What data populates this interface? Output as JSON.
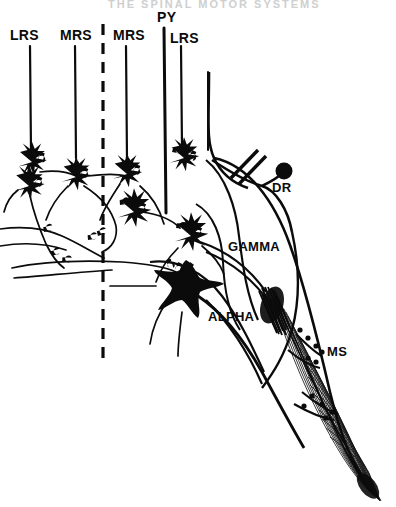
{
  "figure": {
    "kind": "neuroanatomy-schematic",
    "title_faint": "THE SPINAL MOTOR SYSTEMS",
    "background_color": "#ffffff",
    "ink_color": "#0b0b0b",
    "width": 396,
    "height": 507
  },
  "afferent_labels": [
    {
      "id": "lrs-left",
      "text": "LRS",
      "x": 10,
      "y": 28
    },
    {
      "id": "mrs-left",
      "text": "MRS",
      "x": 60,
      "y": 28
    },
    {
      "id": "mrs-right",
      "text": "MRS",
      "x": 113,
      "y": 28
    },
    {
      "id": "py",
      "text": "PY",
      "x": 157,
      "y": 10
    },
    {
      "id": "lrs-right",
      "text": "LRS",
      "x": 170,
      "y": 31
    }
  ],
  "structure_labels": [
    {
      "id": "dr",
      "text": "DR",
      "x": 272,
      "y": 181
    },
    {
      "id": "gamma",
      "text": "GAMMA",
      "x": 228,
      "y": 240
    },
    {
      "id": "alpha",
      "text": "ALPHA",
      "x": 208,
      "y": 310
    },
    {
      "id": "ms",
      "text": "MS",
      "x": 327,
      "y": 345
    }
  ],
  "tract_lines": [
    {
      "id": "lrs-left-fiber",
      "x": 30,
      "y1": 46,
      "y2": 152,
      "width": 2.2
    },
    {
      "id": "mrs-left-fiber",
      "x": 75,
      "y1": 46,
      "y2": 158,
      "width": 2.2
    },
    {
      "id": "mrs-right-fiber",
      "x": 126,
      "y1": 46,
      "y2": 160,
      "width": 2.2
    },
    {
      "id": "py-fiber",
      "x": 164,
      "y1": 28,
      "y2": 213,
      "width": 3.0
    },
    {
      "id": "lrs-right-fiber",
      "x": 181,
      "y1": 46,
      "y2": 148,
      "width": 2.2
    },
    {
      "id": "far-right-fiber",
      "x": 208,
      "y1": 72,
      "y2": 152,
      "width": 2.0
    }
  ],
  "midline": {
    "id": "midline-dashed",
    "x": 103,
    "y1": 24,
    "y2": 360,
    "dash": "11 8",
    "width": 3.2
  },
  "dorsal_root": {
    "ganglion_cx": 284,
    "ganglion_cy": 171,
    "ganglion_r": 8.5,
    "cut_marks": 2
  },
  "muscle_spindle": {
    "label": "MS",
    "fiber_count": 26,
    "origin_x": 276,
    "origin_y": 292,
    "insertion_x": 372,
    "insertion_y": 492
  },
  "neurons": [
    {
      "id": "interneuron-lrs-left-upper",
      "cx": 32,
      "cy": 162,
      "r": 9
    },
    {
      "id": "interneuron-lrs-left-lower",
      "cx": 29,
      "cy": 185,
      "r": 9
    },
    {
      "id": "interneuron-mrs-left",
      "cx": 76,
      "cy": 176,
      "r": 9
    },
    {
      "id": "interneuron-mrs-right-up",
      "cx": 127,
      "cy": 173,
      "r": 9
    },
    {
      "id": "interneuron-mrs-right-low",
      "cx": 133,
      "cy": 211,
      "r": 10
    },
    {
      "id": "interneuron-py-upper",
      "cx": 183,
      "cy": 157,
      "r": 9
    },
    {
      "id": "interneuron-py-lower",
      "cx": 190,
      "cy": 235,
      "r": 10
    },
    {
      "id": "alpha-motoneuron",
      "cx": 186,
      "cy": 286,
      "r": 17
    }
  ]
}
